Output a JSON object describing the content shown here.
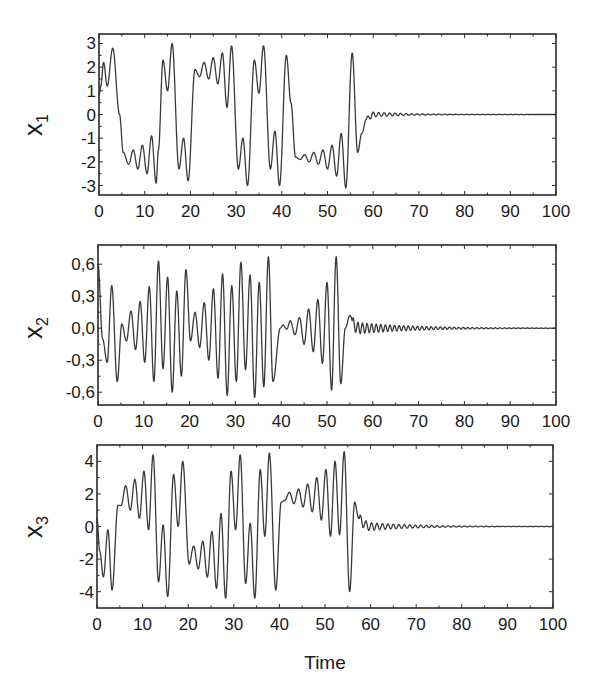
{
  "figure": {
    "xlabel": "Time",
    "line_color": "#3a3a3a",
    "frame_color": "#2a2a2a"
  },
  "chart_data": [
    {
      "type": "line",
      "title": "",
      "ylabel": "x1",
      "ylabel_main": "x",
      "ylabel_sub": "1",
      "xlabel": "",
      "xlim": [
        0,
        100
      ],
      "ylim": [
        -3.4,
        3.4
      ],
      "xticks": [
        "0",
        "10",
        "20",
        "30",
        "40",
        "50",
        "60",
        "70",
        "80",
        "90",
        "100"
      ],
      "yticks": [
        3,
        2,
        1,
        0,
        -1,
        -2,
        -3
      ],
      "ytick_labels": [
        "3",
        "2",
        "1",
        "0",
        "-1",
        "-2",
        "-3"
      ],
      "grid": false,
      "box": {
        "x0": 99,
        "y0": 34,
        "x1": 556,
        "y1": 195
      },
      "keypoints": [
        [
          0,
          0.8
        ],
        [
          0.4,
          1.2
        ],
        [
          1.0,
          2.2
        ],
        [
          1.8,
          1.2
        ],
        [
          3.0,
          2.8
        ],
        [
          4.5,
          0
        ],
        [
          5.3,
          -1.6
        ],
        [
          6.5,
          -2.1
        ],
        [
          7.5,
          -1.5
        ],
        [
          8.5,
          -2.3
        ],
        [
          9.5,
          -1.3
        ],
        [
          10.5,
          -2.5
        ],
        [
          11.5,
          -0.9
        ],
        [
          12.5,
          -2.9
        ],
        [
          13.0,
          -1.5
        ],
        [
          14.0,
          2.3
        ],
        [
          15.0,
          1.0
        ],
        [
          16.0,
          3.0
        ],
        [
          17.5,
          -2.3
        ],
        [
          18.5,
          -1.0
        ],
        [
          19.5,
          -2.8
        ],
        [
          21.0,
          1.9
        ],
        [
          22.0,
          1.6
        ],
        [
          23.0,
          2.2
        ],
        [
          24.0,
          1.5
        ],
        [
          25.0,
          2.4
        ],
        [
          26.0,
          1.3
        ],
        [
          27.0,
          2.6
        ],
        [
          28.0,
          0.3
        ],
        [
          29.0,
          2.9
        ],
        [
          30.5,
          -2.3
        ],
        [
          31.5,
          -1.0
        ],
        [
          32.5,
          -3.0
        ],
        [
          34.0,
          2.3
        ],
        [
          35.0,
          0.9
        ],
        [
          36.0,
          2.9
        ],
        [
          37.5,
          -2.3
        ],
        [
          38.5,
          -0.7
        ],
        [
          39.5,
          -3.0
        ],
        [
          41.0,
          2.5
        ],
        [
          42.0,
          0.5
        ],
        [
          43.0,
          -1.8
        ],
        [
          44.0,
          -1.9
        ],
        [
          45.0,
          -1.7
        ],
        [
          46.0,
          -2.0
        ],
        [
          47.0,
          -1.6
        ],
        [
          48.0,
          -2.1
        ],
        [
          49.0,
          -1.5
        ],
        [
          50.0,
          -2.3
        ],
        [
          51.0,
          -1.3
        ],
        [
          52.0,
          -2.6
        ],
        [
          53.0,
          -0.8
        ],
        [
          54.0,
          -3.1
        ],
        [
          55.4,
          2.6
        ],
        [
          56.6,
          -1.6
        ],
        [
          57.5,
          -0.8
        ],
        [
          58.5,
          -0.2
        ],
        [
          60,
          0
        ],
        [
          100,
          0
        ]
      ],
      "settle_ripple": {
        "start": 58.5,
        "amp": 0.12,
        "period": 1.2,
        "decay": 8
      }
    },
    {
      "type": "line",
      "title": "",
      "ylabel": "x2",
      "ylabel_main": "x",
      "ylabel_sub": "2",
      "xlabel": "",
      "xlim": [
        0,
        100
      ],
      "ylim": [
        -0.72,
        0.78
      ],
      "xticks": [
        "0",
        "10",
        "20",
        "30",
        "40",
        "50",
        "60",
        "70",
        "80",
        "90",
        "100"
      ],
      "yticks": [
        0.6,
        0.3,
        0.0,
        -0.3,
        -0.6
      ],
      "ytick_labels": [
        "0,6",
        "0,3",
        "0,0",
        "-0,3",
        "-0,6"
      ],
      "grid": false,
      "box": {
        "x0": 98,
        "y0": 245,
        "x1": 556,
        "y1": 405
      },
      "keypoints": [
        [
          0,
          0.6
        ],
        [
          1.0,
          -0.1
        ],
        [
          2.0,
          -0.32
        ],
        [
          3.0,
          0.4
        ],
        [
          4.2,
          -0.5
        ],
        [
          5.2,
          0.04
        ],
        [
          6.2,
          -0.12
        ],
        [
          7.2,
          0.16
        ],
        [
          8.2,
          -0.2
        ],
        [
          9.2,
          0.25
        ],
        [
          10.2,
          -0.32
        ],
        [
          11.2,
          0.39
        ],
        [
          12.2,
          -0.5
        ],
        [
          13.2,
          0.63
        ],
        [
          14.2,
          -0.38
        ],
        [
          15.2,
          0.48
        ],
        [
          16.2,
          -0.6
        ],
        [
          17.2,
          0.35
        ],
        [
          18.2,
          -0.45
        ],
        [
          19.2,
          0.55
        ],
        [
          20.2,
          -0.12
        ],
        [
          21.2,
          0.15
        ],
        [
          22.2,
          -0.18
        ],
        [
          23.2,
          0.24
        ],
        [
          24.2,
          -0.3
        ],
        [
          25.2,
          0.37
        ],
        [
          26.2,
          -0.47
        ],
        [
          27.2,
          0.51
        ],
        [
          28.2,
          -0.63
        ],
        [
          29.2,
          0.4
        ],
        [
          30.2,
          -0.5
        ],
        [
          31.2,
          0.62
        ],
        [
          32.2,
          -0.39
        ],
        [
          33.2,
          0.5
        ],
        [
          34.2,
          -0.65
        ],
        [
          35.2,
          0.43
        ],
        [
          36.2,
          -0.55
        ],
        [
          37.2,
          0.67
        ],
        [
          38.2,
          -0.5
        ],
        [
          39.8,
          0.0
        ],
        [
          40.4,
          0.03
        ],
        [
          41.2,
          -0.01
        ],
        [
          42.0,
          0.07
        ],
        [
          43.0,
          -0.06
        ],
        [
          44.0,
          0.1
        ],
        [
          45.0,
          -0.15
        ],
        [
          46.0,
          0.18
        ],
        [
          47.0,
          -0.22
        ],
        [
          48.0,
          0.27
        ],
        [
          49.0,
          -0.33
        ],
        [
          50.0,
          0.43
        ],
        [
          51.0,
          -0.58
        ],
        [
          52.0,
          0.67
        ],
        [
          53.0,
          -0.52
        ],
        [
          54.0,
          0.0
        ],
        [
          55.0,
          0.12
        ],
        [
          56.0,
          0.02
        ],
        [
          57.0,
          0.0
        ],
        [
          100,
          0
        ]
      ],
      "settle_ripple": {
        "start": 55.5,
        "amp": 0.06,
        "period": 1.0,
        "decay": 12
      }
    },
    {
      "type": "line",
      "title": "",
      "ylabel": "x3",
      "ylabel_main": "x",
      "ylabel_sub": "3",
      "xlabel": "Time",
      "xlim": [
        0,
        100
      ],
      "ylim": [
        -5,
        5
      ],
      "xticks": [
        "0",
        "10",
        "20",
        "30",
        "40",
        "50",
        "60",
        "70",
        "80",
        "90",
        "100"
      ],
      "yticks": [
        4,
        2,
        0,
        -2,
        -4
      ],
      "ytick_labels": [
        "4",
        "2",
        "0",
        "-2",
        "-4"
      ],
      "grid": false,
      "box": {
        "x0": 97,
        "y0": 445,
        "x1": 553,
        "y1": 608
      },
      "keypoints": [
        [
          0,
          0.5
        ],
        [
          0.6,
          -1.5
        ],
        [
          1.4,
          -3.1
        ],
        [
          2.4,
          -0.2
        ],
        [
          3.3,
          -3.9
        ],
        [
          4.6,
          1.3
        ],
        [
          5.3,
          1.3
        ],
        [
          6.3,
          2.5
        ],
        [
          7.3,
          1.0
        ],
        [
          8.3,
          2.9
        ],
        [
          9.3,
          0.5
        ],
        [
          10.3,
          3.4
        ],
        [
          11.3,
          -0.2
        ],
        [
          12.3,
          4.4
        ],
        [
          13.5,
          -3.4
        ],
        [
          14.5,
          0.1
        ],
        [
          15.5,
          -4.3
        ],
        [
          16.8,
          3.2
        ],
        [
          17.8,
          0.0
        ],
        [
          18.8,
          4.0
        ],
        [
          20.2,
          -2.3
        ],
        [
          21.2,
          -1.2
        ],
        [
          22.2,
          -2.6
        ],
        [
          23.2,
          -0.9
        ],
        [
          24.2,
          -3.1
        ],
        [
          25.2,
          -0.3
        ],
        [
          26.2,
          -3.8
        ],
        [
          27.2,
          0.8
        ],
        [
          28.2,
          -4.4
        ],
        [
          29.4,
          3.4
        ],
        [
          30.4,
          -0.2
        ],
        [
          31.4,
          4.4
        ],
        [
          32.6,
          -3.5
        ],
        [
          33.6,
          0.2
        ],
        [
          34.6,
          -4.4
        ],
        [
          35.8,
          3.5
        ],
        [
          36.8,
          -0.6
        ],
        [
          37.8,
          4.5
        ],
        [
          39.2,
          -3.9
        ],
        [
          40.4,
          1.5
        ],
        [
          41.2,
          1.6
        ],
        [
          42.2,
          2.1
        ],
        [
          43.2,
          1.4
        ],
        [
          44.2,
          2.3
        ],
        [
          45.2,
          1.2
        ],
        [
          46.2,
          2.6
        ],
        [
          47.2,
          0.9
        ],
        [
          48.2,
          3.0
        ],
        [
          49.2,
          0.4
        ],
        [
          50.2,
          3.5
        ],
        [
          51.2,
          -0.6
        ],
        [
          52.2,
          4.0
        ],
        [
          53.2,
          -0.5
        ],
        [
          54.2,
          4.6
        ],
        [
          55.4,
          -4.0
        ],
        [
          56.5,
          1.5
        ],
        [
          57.4,
          0.5
        ],
        [
          58.4,
          0.2
        ],
        [
          59.5,
          0.0
        ],
        [
          100,
          0
        ]
      ],
      "settle_ripple": {
        "start": 57.5,
        "amp": 0.3,
        "period": 1.2,
        "decay": 10
      }
    }
  ]
}
